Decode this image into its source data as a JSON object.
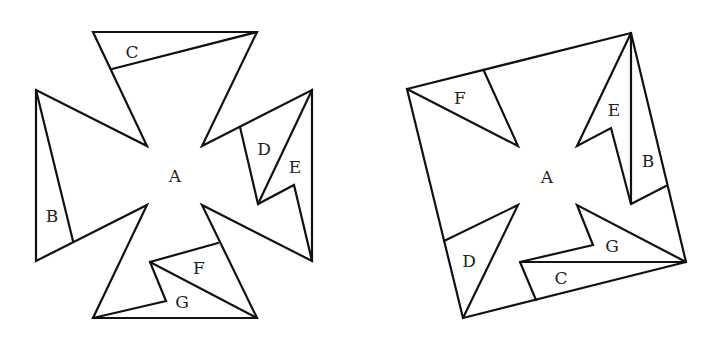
{
  "figure": {
    "left": {
      "name": "cross-dissection",
      "labels": {
        "A": "A",
        "B": "B",
        "C": "C",
        "D": "D",
        "E": "E",
        "F": "F",
        "G": "G"
      },
      "label_positions": {
        "A": [
          175,
          176
        ],
        "B": [
          52,
          216
        ],
        "C": [
          132,
          52
        ],
        "D": [
          264,
          149
        ],
        "E": [
          295,
          167
        ],
        "F": [
          199,
          268
        ],
        "G": [
          182,
          302
        ]
      }
    },
    "right": {
      "name": "square-rearrangement",
      "labels": {
        "A": "A",
        "B": "B",
        "C": "C",
        "D": "D",
        "E": "E",
        "F": "F",
        "G": "G"
      },
      "label_positions": {
        "A": [
          547,
          177
        ],
        "B": [
          648,
          161
        ],
        "C": [
          561,
          278
        ],
        "D": [
          469,
          261
        ],
        "E": [
          614,
          110
        ],
        "F": [
          460,
          98
        ],
        "G": [
          612,
          246
        ]
      }
    }
  },
  "colors": {
    "stroke": "#111111",
    "text": "#222222",
    "background": "#ffffff"
  }
}
